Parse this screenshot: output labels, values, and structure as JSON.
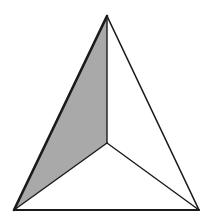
{
  "diagram": {
    "type": "tetrahedron-projection",
    "vertices": {
      "apex": [
        107,
        16
      ],
      "bottom_left": [
        14,
        210
      ],
      "bottom_right": [
        199,
        210
      ],
      "center": [
        107,
        143
      ]
    },
    "faces": [
      {
        "name": "left-face",
        "points": [
          "apex",
          "bottom_left",
          "center"
        ],
        "fill": "#a9a9a9",
        "shaded": true
      },
      {
        "name": "right-face",
        "points": [
          "apex",
          "center",
          "bottom_right"
        ],
        "fill": "#ffffff",
        "shaded": false
      },
      {
        "name": "bottom-face",
        "points": [
          "bottom_left",
          "bottom_right",
          "center"
        ],
        "fill": "#ffffff",
        "shaded": false
      }
    ],
    "colors": {
      "stroke": "#1a1a1a",
      "shade": "#a9a9a9",
      "background": "#ffffff"
    },
    "stroke_widths": {
      "outer_left": 2.6,
      "outer_right": 1.6,
      "outer_bottom": 2.0,
      "inner": 1.4
    }
  }
}
